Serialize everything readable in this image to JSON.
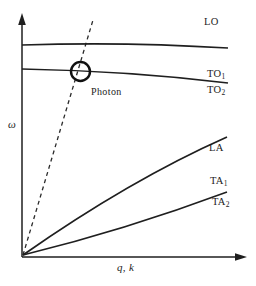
{
  "figure": {
    "type": "phonon-dispersion-schematic",
    "colors": {
      "background": "#ffffff",
      "line": "#1f1f1f",
      "text": "#1c1c1c"
    },
    "axes": {
      "y_label": "ω",
      "x_label": "q, k"
    },
    "branches": [
      {
        "label": "LO",
        "sub": ""
      },
      {
        "label": "TO",
        "sub": "1"
      },
      {
        "label": "TO",
        "sub": "2"
      },
      {
        "label": "LA",
        "sub": ""
      },
      {
        "label": "TA",
        "sub": "1"
      },
      {
        "label": "TA",
        "sub": "2"
      }
    ],
    "annotations": {
      "photon": "Photon"
    }
  }
}
